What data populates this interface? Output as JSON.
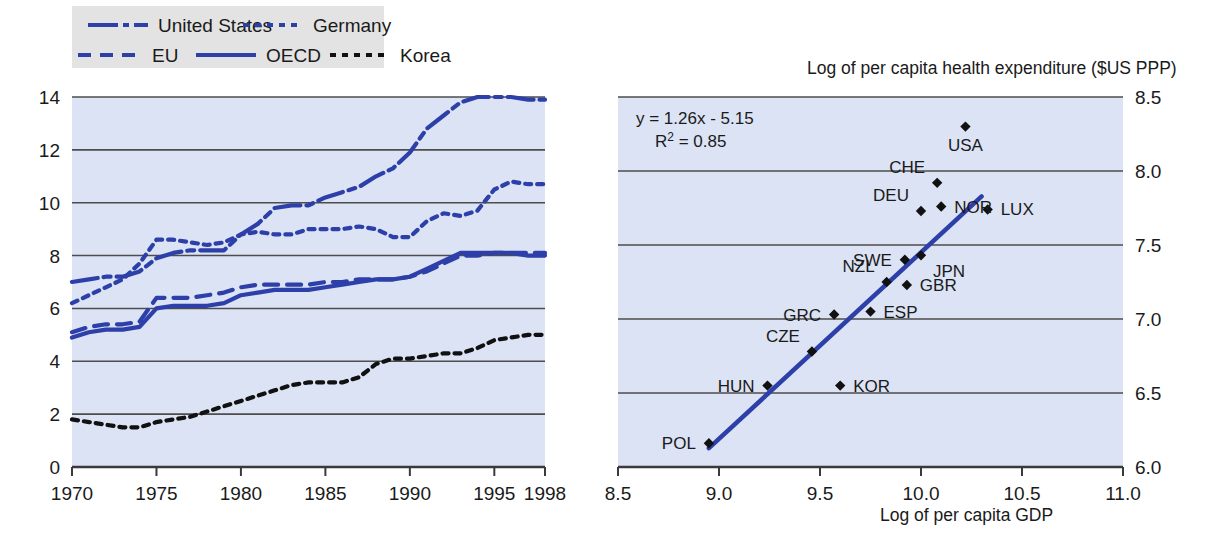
{
  "figure": {
    "background": "#ffffff",
    "panel_fill": "#dbe3f4",
    "legend_fill": "#e3e3e3",
    "series_color": "#2d3fa8",
    "korea_color": "#111111",
    "gridline_color": "#5a5a5a",
    "marker_color": "#111111"
  },
  "left_panel": {
    "legend": {
      "items": [
        {
          "label": "United States",
          "style": "dash-dot",
          "color": "#2d3fa8"
        },
        {
          "label": "Germany",
          "style": "dotted",
          "color": "#2d3fa8"
        },
        {
          "label": "EU",
          "style": "dashed",
          "color": "#2d3fa8"
        },
        {
          "label": "OECD",
          "style": "solid",
          "color": "#2d3fa8"
        },
        {
          "label": "Korea",
          "style": "dotted",
          "color": "#111111"
        }
      ]
    },
    "y_ticks": [
      "0",
      "2",
      "4",
      "6",
      "8",
      "10",
      "12",
      "14"
    ],
    "x_ticks": [
      "1970",
      "1975",
      "1980",
      "1985",
      "1990",
      "1995",
      "1998"
    ]
  },
  "right_panel": {
    "y_title": "Log of per capita health expenditure ($US PPP)",
    "x_title": "Log of per capita GDP",
    "equation": "y = 1.26x - 5.15",
    "r_squared_prefix": "R",
    "r_squared_exp": "2",
    "r_squared_value": "= 0.85",
    "y_ticks": [
      "6.0",
      "6.5",
      "7.0",
      "7.5",
      "8.0",
      "8.5"
    ],
    "x_ticks": [
      "8.5",
      "9.0",
      "9.5",
      "10.0",
      "10.5",
      "11.0"
    ]
  },
  "chart_data": [
    {
      "type": "line",
      "title": "",
      "xlabel": "",
      "ylabel": "",
      "xlim": [
        1970,
        1998
      ],
      "ylim": [
        0,
        14
      ],
      "grid": true,
      "legend_position": "above-plot",
      "x": [
        1970,
        1971,
        1972,
        1973,
        1974,
        1975,
        1976,
        1977,
        1978,
        1979,
        1980,
        1981,
        1982,
        1983,
        1984,
        1985,
        1986,
        1987,
        1988,
        1989,
        1990,
        1991,
        1992,
        1993,
        1994,
        1995,
        1996,
        1997,
        1998
      ],
      "series": [
        {
          "name": "United States",
          "style": "dash-dot",
          "color": "#2d3fa8",
          "values": [
            7.0,
            7.1,
            7.2,
            7.2,
            7.4,
            7.9,
            8.1,
            8.2,
            8.2,
            8.2,
            8.8,
            9.2,
            9.8,
            9.9,
            9.9,
            10.2,
            10.4,
            10.6,
            11.0,
            11.3,
            11.9,
            12.8,
            13.3,
            13.8,
            14.0,
            14.0,
            14.0,
            13.9,
            13.9
          ]
        },
        {
          "name": "Germany",
          "style": "dotted",
          "color": "#2d3fa8",
          "values": [
            6.2,
            6.5,
            6.8,
            7.1,
            7.7,
            8.6,
            8.6,
            8.5,
            8.4,
            8.5,
            8.8,
            8.9,
            8.8,
            8.8,
            9.0,
            9.0,
            9.0,
            9.1,
            9.0,
            8.7,
            8.7,
            9.3,
            9.6,
            9.5,
            9.7,
            10.5,
            10.8,
            10.7,
            10.7
          ]
        },
        {
          "name": "EU",
          "style": "dashed",
          "color": "#2d3fa8",
          "values": [
            5.1,
            5.3,
            5.4,
            5.4,
            5.5,
            6.4,
            6.4,
            6.4,
            6.5,
            6.6,
            6.8,
            6.9,
            6.9,
            6.9,
            6.9,
            7.0,
            7.0,
            7.1,
            7.1,
            7.1,
            7.2,
            7.4,
            7.7,
            8.0,
            8.0,
            8.1,
            8.1,
            8.1,
            8.1
          ]
        },
        {
          "name": "OECD",
          "style": "solid",
          "color": "#2d3fa8",
          "values": [
            4.9,
            5.1,
            5.2,
            5.2,
            5.3,
            6.0,
            6.1,
            6.1,
            6.1,
            6.2,
            6.5,
            6.6,
            6.7,
            6.7,
            6.7,
            6.8,
            6.9,
            7.0,
            7.1,
            7.1,
            7.2,
            7.5,
            7.8,
            8.1,
            8.1,
            8.1,
            8.1,
            8.0,
            8.0
          ]
        },
        {
          "name": "Korea",
          "style": "dotted",
          "color": "#111111",
          "values": [
            1.8,
            1.7,
            1.6,
            1.5,
            1.5,
            1.7,
            1.8,
            1.9,
            2.1,
            2.3,
            2.5,
            2.7,
            2.9,
            3.1,
            3.2,
            3.2,
            3.2,
            3.4,
            3.9,
            4.1,
            4.1,
            4.2,
            4.3,
            4.3,
            4.5,
            4.8,
            4.9,
            5.0,
            5.0
          ]
        }
      ]
    },
    {
      "type": "scatter",
      "title": "",
      "xlabel": "Log of per capita GDP",
      "ylabel": "Log of per capita health expenditure ($US PPP)",
      "xlim": [
        8.5,
        11.0
      ],
      "ylim": [
        6.0,
        8.5
      ],
      "grid": true,
      "annotation": [
        "y = 1.26x - 5.15",
        "R2 = 0.85"
      ],
      "trendline": {
        "slope": 1.26,
        "intercept": -5.15,
        "x_start": 8.95,
        "x_end": 10.3
      },
      "points": [
        {
          "label": "POL",
          "x": 8.95,
          "y": 6.16,
          "label_pos": "left"
        },
        {
          "label": "HUN",
          "x": 9.24,
          "y": 6.55,
          "label_pos": "left"
        },
        {
          "label": "KOR",
          "x": 9.6,
          "y": 6.55,
          "label_pos": "right"
        },
        {
          "label": "CZE",
          "x": 9.46,
          "y": 6.78,
          "label_pos": "upper-left"
        },
        {
          "label": "GRC",
          "x": 9.57,
          "y": 7.03,
          "label_pos": "left"
        },
        {
          "label": "ESP",
          "x": 9.75,
          "y": 7.05,
          "label_pos": "right"
        },
        {
          "label": "NZL",
          "x": 9.83,
          "y": 7.25,
          "label_pos": "upper-left"
        },
        {
          "label": "GBR",
          "x": 9.93,
          "y": 7.23,
          "label_pos": "right"
        },
        {
          "label": "SWE",
          "x": 9.92,
          "y": 7.4,
          "label_pos": "left"
        },
        {
          "label": "JPN",
          "x": 10.0,
          "y": 7.43,
          "label_pos": "lower-right"
        },
        {
          "label": "DEU",
          "x": 10.0,
          "y": 7.73,
          "label_pos": "upper-left"
        },
        {
          "label": "NOR",
          "x": 10.1,
          "y": 7.76,
          "label_pos": "right"
        },
        {
          "label": "LUX",
          "x": 10.33,
          "y": 7.74,
          "label_pos": "right"
        },
        {
          "label": "CHE",
          "x": 10.08,
          "y": 7.92,
          "label_pos": "upper-left"
        },
        {
          "label": "USA",
          "x": 10.22,
          "y": 8.3,
          "label_pos": "below"
        }
      ]
    }
  ]
}
